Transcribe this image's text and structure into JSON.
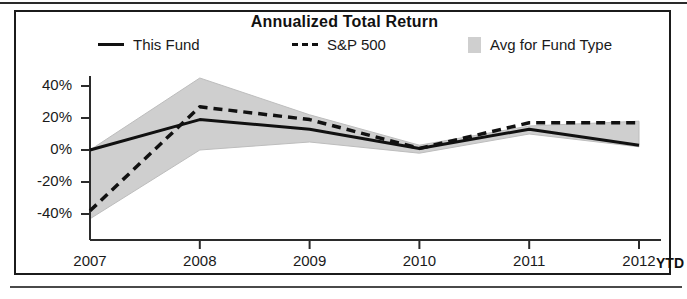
{
  "chart_data": {
    "type": "line",
    "title": "Annualized Total Return",
    "xlabel": "",
    "ylabel": "",
    "x": [
      "2007",
      "2008",
      "2009",
      "2010",
      "2011",
      "2012"
    ],
    "xtick_labels": [
      "2007",
      "2008",
      "2009",
      "2010",
      "2011",
      "2012"
    ],
    "x_axis_suffix": "YTD",
    "ytick_labels": [
      "40%",
      "20%",
      "0%",
      "-20%",
      "-40%"
    ],
    "ytick_values": [
      40,
      20,
      0,
      -20,
      -40
    ],
    "ylim": [
      -48,
      50
    ],
    "grid": false,
    "legend_position": "top",
    "series": [
      {
        "name": "This Fund",
        "style": "solid",
        "color": "#111111",
        "values": [
          0,
          19,
          13,
          1,
          13,
          3
        ]
      },
      {
        "name": "S&P 500",
        "style": "dashed",
        "color": "#111111",
        "values": [
          -38,
          27,
          19,
          1,
          17,
          17
        ]
      }
    ],
    "band": {
      "name": "Avg for Fund Type",
      "color": "#cfcfcf",
      "upper": [
        0,
        45,
        22,
        3,
        15,
        18
      ],
      "lower": [
        -43,
        0,
        5,
        -2,
        10,
        2
      ]
    }
  },
  "legend": {
    "items": [
      {
        "label": "This Fund",
        "swatch": "solid-line-swatch"
      },
      {
        "label": "S&P 500",
        "swatch": "dashed-line-swatch"
      },
      {
        "label": "Avg for Fund Type",
        "swatch": "band-swatch"
      }
    ]
  }
}
